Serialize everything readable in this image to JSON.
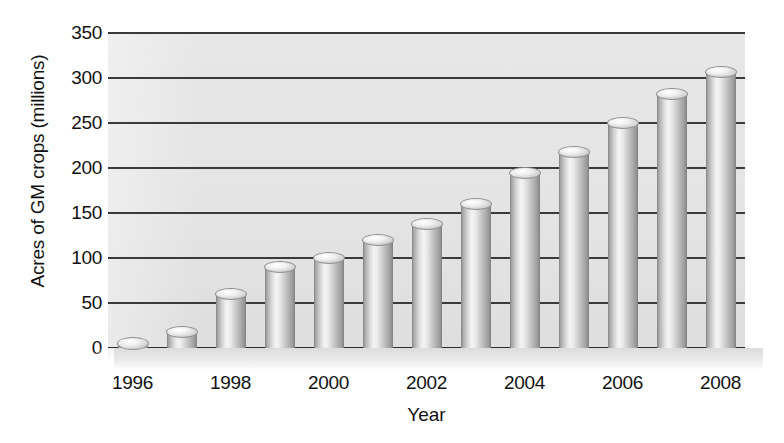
{
  "chart_data": {
    "type": "bar",
    "title": "",
    "xlabel": "Year",
    "ylabel": "Acres of GM crops (millions)",
    "categories": [
      "1996",
      "1997",
      "1998",
      "1999",
      "2000",
      "2001",
      "2002",
      "2003",
      "2004",
      "2005",
      "2006",
      "2007",
      "2008"
    ],
    "values": [
      4,
      18,
      60,
      90,
      100,
      120,
      138,
      160,
      195,
      218,
      250,
      282,
      307
    ],
    "ylim": [
      0,
      350
    ],
    "yticks": [
      0,
      50,
      100,
      150,
      200,
      250,
      300,
      350
    ],
    "ytick_labels": [
      "0",
      "50",
      "100",
      "150",
      "200",
      "250",
      "300",
      "350"
    ],
    "xtick_labels": [
      "1996",
      "1998",
      "2000",
      "2002",
      "2004",
      "2006",
      "2008"
    ],
    "xtick_categories": [
      "1996",
      "1998",
      "2000",
      "2002",
      "2004",
      "2006",
      "2008"
    ],
    "grid": true,
    "legend": "none",
    "style": "3d-cylinder",
    "colors": {
      "plot_background": "#e5e5e5",
      "gridline": "#3a3a3a",
      "bar_light": "#f4f4f4",
      "bar_mid": "#cfcfcf",
      "bar_dark": "#8e8e8e",
      "text": "#111111",
      "page_background": "#ffffff"
    }
  }
}
